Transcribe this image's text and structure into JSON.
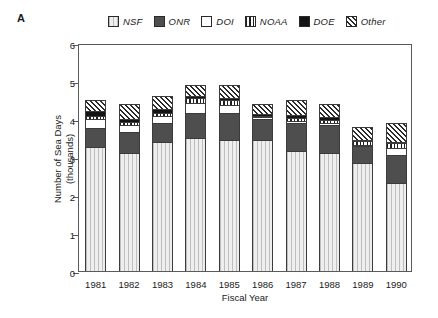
{
  "panel": {
    "label": "A"
  },
  "legend": {
    "position": "top",
    "entries": [
      {
        "name": "NSF",
        "pattern": "light-dotted",
        "swatch": "fill-nsf"
      },
      {
        "name": "ONR",
        "pattern": "dark-gray-solid",
        "swatch": "fill-onr"
      },
      {
        "name": "DOI",
        "pattern": "white-solid",
        "swatch": "fill-doi"
      },
      {
        "name": "NOAA",
        "pattern": "vertical-lines",
        "swatch": "fill-noaa"
      },
      {
        "name": "DOE",
        "pattern": "black-solid",
        "swatch": "fill-doe"
      },
      {
        "name": "Other",
        "pattern": "diagonal-hatch",
        "swatch": "fill-other"
      }
    ]
  },
  "axes": {
    "y_label_line1": "Number of Sea Days",
    "y_label_line2": "(thousands)",
    "x_label": "Fiscal Year",
    "y_ticks": [
      "0",
      "1",
      "2",
      "3",
      "4",
      "5",
      "6"
    ],
    "x_ticks": [
      "1981",
      "1982",
      "1983",
      "1984",
      "1985",
      "1986",
      "1987",
      "1988",
      "1989",
      "1990"
    ]
  },
  "chart_data": {
    "type": "bar",
    "stacked": true,
    "title": "",
    "xlabel": "Fiscal Year",
    "ylabel": "Number of Sea Days (thousands)",
    "ylim": [
      0,
      6
    ],
    "yticks": [
      0,
      1,
      2,
      3,
      4,
      5,
      6
    ],
    "grid": false,
    "legend_position": "top",
    "categories": [
      "1981",
      "1982",
      "1983",
      "1984",
      "1985",
      "1986",
      "1987",
      "1988",
      "1989",
      "1990"
    ],
    "series": [
      {
        "name": "NSF",
        "values": [
          3.25,
          3.1,
          3.4,
          3.5,
          3.45,
          3.45,
          3.15,
          3.1,
          2.85,
          2.3
        ]
      },
      {
        "name": "ONR",
        "values": [
          0.5,
          0.55,
          0.5,
          0.65,
          0.7,
          0.55,
          0.75,
          0.75,
          0.45,
          0.75
        ]
      },
      {
        "name": "DOI",
        "values": [
          0.25,
          0.2,
          0.18,
          0.28,
          0.22,
          0.05,
          0.05,
          0.05,
          0.03,
          0.18
        ]
      },
      {
        "name": "NOAA",
        "values": [
          0.08,
          0.07,
          0.07,
          0.13,
          0.13,
          0.03,
          0.06,
          0.06,
          0.09,
          0.13
        ]
      },
      {
        "name": "DOE",
        "values": [
          0.14,
          0.08,
          0.12,
          0.05,
          0.05,
          0.06,
          0.09,
          0.09,
          0.02,
          0.03
        ]
      },
      {
        "name": "Other",
        "values": [
          0.28,
          0.4,
          0.33,
          0.29,
          0.35,
          0.26,
          0.4,
          0.35,
          0.36,
          0.51
        ]
      }
    ],
    "totals": [
      4.5,
      4.4,
      4.6,
      4.9,
      4.9,
      4.4,
      4.5,
      4.4,
      3.8,
      3.9
    ]
  }
}
